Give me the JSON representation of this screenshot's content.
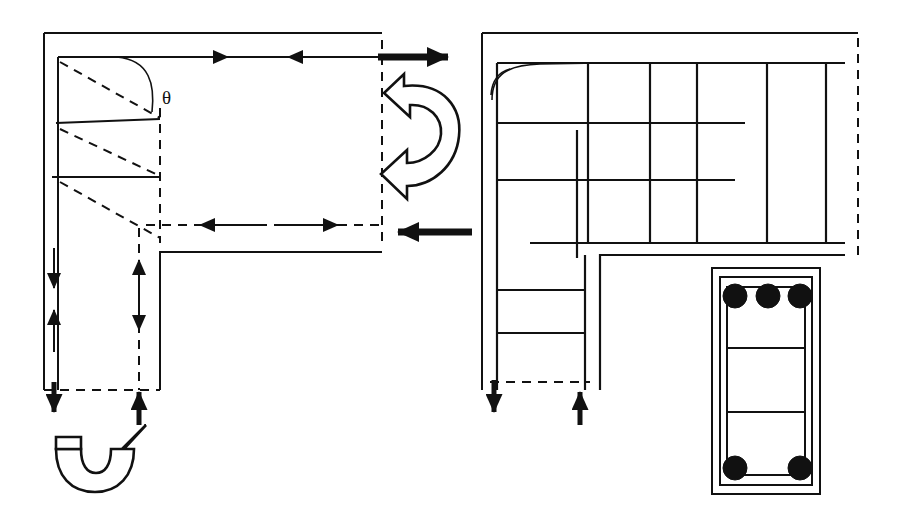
{
  "figure": {
    "background_color": "#ffffff",
    "line_color": "#111111",
    "annotations": [
      {
        "id": "theta",
        "label": "θ",
        "x": 168,
        "y": 97,
        "description": "rotation angle symbol theta"
      }
    ]
  },
  "panels": [
    {
      "id": "left-panel",
      "name": "force-and-deformation-diagram",
      "description": "L-shaped joint outline with dashed deformed shape, strain wedges, and force/moment arrows"
    },
    {
      "id": "right-panel",
      "name": "reinforcement-layout-diagram",
      "description": "L-shaped joint with orthogonal reinforcement bar grid and support reactions"
    },
    {
      "id": "section-detail",
      "name": "rebar-cross-section",
      "description": "Rectangular column section with stirrup and longitudinal reinforcing bars"
    }
  ],
  "left_panel": {
    "outline": {
      "points": "44,33 382,33 382,243 160,243 160,390 44,390",
      "style": "solid thin outer boundary, open right/bottom"
    },
    "inner_solid_lines": [
      {
        "name": "top-inner-edge",
        "x1": 58,
        "y1": 57,
        "x2": 382,
        "y2": 57
      },
      {
        "name": "left-inner-edge",
        "x1": 58,
        "y1": 57,
        "x2": 58,
        "y2": 390
      },
      {
        "name": "strain-line-1",
        "x1": 58,
        "y1": 124,
        "x2": 160,
        "y2": 120
      },
      {
        "name": "strain-line-2",
        "x1": 52,
        "y1": 177,
        "x2": 160,
        "y2": 177
      },
      {
        "name": "inner-corner-vertical",
        "x1": 160,
        "y1": 252,
        "x2": 160,
        "y2": 390
      },
      {
        "name": "inner-corner-horizontal",
        "x1": 160,
        "y1": 252,
        "x2": 382,
        "y2": 252
      }
    ],
    "dashed_lines": [
      {
        "name": "deformed-diag-1",
        "x1": 58,
        "y1": 62,
        "x2": 160,
        "y2": 120
      },
      {
        "name": "deformed-diag-2",
        "x1": 58,
        "y1": 130,
        "x2": 160,
        "y2": 180
      },
      {
        "name": "deformed-diag-3",
        "x1": 58,
        "y1": 183,
        "x2": 160,
        "y2": 240
      },
      {
        "name": "vertical-dashed-neutral-axis",
        "x1": 160,
        "y1": 110,
        "x2": 160,
        "y2": 243
      },
      {
        "name": "vertical-dashed-center",
        "x1": 139,
        "y1": 243,
        "x2": 139,
        "y2": 390
      },
      {
        "name": "bottom-dashed",
        "x1": 58,
        "y1": 390,
        "x2": 160,
        "y2": 390
      },
      {
        "name": "right-dashed-edge",
        "x1": 382,
        "y1": 57,
        "x2": 382,
        "y2": 243
      },
      {
        "name": "mid-dashed-horizontal",
        "x1": 160,
        "y1": 225,
        "x2": 382,
        "y2": 225
      }
    ],
    "arrows": [
      {
        "name": "top-arrow-right",
        "direction": "right",
        "type": "thin",
        "x1": 150,
        "y1": 57,
        "x2": 228,
        "y2": 57,
        "label": ""
      },
      {
        "name": "top-arrow-left",
        "direction": "left",
        "type": "thin",
        "x1": 340,
        "y1": 57,
        "x2": 287,
        "y2": 57,
        "label": ""
      },
      {
        "name": "mid-arrow-left",
        "direction": "left",
        "type": "thin",
        "x1": 260,
        "y1": 225,
        "x2": 198,
        "y2": 225,
        "label": ""
      },
      {
        "name": "mid-arrow-right",
        "direction": "right",
        "type": "thin",
        "x1": 275,
        "y1": 225,
        "x2": 335,
        "y2": 225,
        "label": ""
      },
      {
        "name": "applied-force-top-right",
        "direction": "right",
        "type": "thick",
        "x1": 378,
        "y1": 57,
        "x2": 462,
        "y2": 57,
        "label": ""
      },
      {
        "name": "applied-force-mid-right",
        "direction": "left",
        "type": "thick",
        "x1": 470,
        "y1": 232,
        "x2": 382,
        "y2": 232,
        "label": ""
      },
      {
        "name": "left-reaction-down",
        "direction": "down",
        "type": "thin",
        "x1": 54,
        "y1": 250,
        "x2": 54,
        "y2": 290,
        "label": ""
      },
      {
        "name": "left-reaction-up",
        "direction": "up",
        "type": "thin",
        "x1": 54,
        "y1": 352,
        "x2": 54,
        "y2": 308,
        "label": ""
      },
      {
        "name": "left-reaction-thick-down",
        "direction": "down",
        "type": "thick",
        "x1": 54,
        "y1": 382,
        "x2": 54,
        "y2": 425,
        "label": ""
      },
      {
        "name": "center-reaction-up",
        "direction": "up",
        "type": "thin",
        "x1": 139,
        "y1": 300,
        "x2": 139,
        "y2": 258,
        "label": ""
      },
      {
        "name": "center-reaction-down",
        "direction": "down",
        "type": "thin",
        "x1": 139,
        "y1": 300,
        "x2": 139,
        "y2": 335,
        "label": ""
      },
      {
        "name": "center-reaction-thick-up",
        "direction": "up",
        "type": "thick",
        "x1": 139,
        "y1": 425,
        "x2": 139,
        "y2": 382,
        "label": ""
      }
    ],
    "moment_arrows": [
      {
        "name": "moment-arrow-clockwise-top",
        "position": "right of joint, upper",
        "rotation": "clockwise",
        "cx": 421,
        "cy": 137
      },
      {
        "name": "moment-arrow-counterclockwise-bottom",
        "position": "below left column",
        "rotation": "counterclockwise",
        "cx": 106,
        "cy": 462
      }
    ],
    "curve": {
      "name": "rotation-arc",
      "description": "small arc marking rotation angle theta near top-left corner"
    }
  },
  "right_panel": {
    "outline": {
      "points": "482,33 860,33 860,240 600,240 600,390 482,390",
      "style": "solid thin outer boundary with dashed right edge"
    },
    "inner_edges": [
      {
        "name": "inner-top",
        "x1": 497,
        "y1": 63,
        "x2": 845,
        "y2": 63
      },
      {
        "name": "inner-left",
        "x1": 497,
        "y1": 63,
        "x2": 497,
        "y2": 390
      },
      {
        "name": "inner-bottom-right",
        "x1": 585,
        "y1": 255,
        "x2": 845,
        "y2": 255
      },
      {
        "name": "inner-right-vertical",
        "x1": 585,
        "y1": 255,
        "x2": 585,
        "y2": 390
      }
    ],
    "reinforcement_grid": {
      "vertical_bars": [
        {
          "name": "vbar-1",
          "x": 588,
          "y1": 63,
          "y2": 243
        },
        {
          "name": "vbar-2",
          "x": 650,
          "y1": 63,
          "y2": 243
        },
        {
          "name": "vbar-3",
          "x": 697,
          "y1": 63,
          "y2": 243
        },
        {
          "name": "vbar-4",
          "x": 767,
          "y1": 63,
          "y2": 243
        },
        {
          "name": "vbar-5",
          "x": 826,
          "y1": 63,
          "y2": 243
        },
        {
          "name": "vbar-short-stub",
          "x": 577,
          "y1": 130,
          "y2": 255
        }
      ],
      "horizontal_bars": [
        {
          "name": "hbar-1",
          "y": 123,
          "x1": 497,
          "x2": 745
        },
        {
          "name": "hbar-2",
          "y": 180,
          "x1": 497,
          "x2": 735
        },
        {
          "name": "hbar-3",
          "y": 243,
          "x1": 530,
          "x2": 845
        },
        {
          "name": "hbar-4",
          "y": 290,
          "x1": 497,
          "x2": 585
        },
        {
          "name": "hbar-5",
          "y": 333,
          "x1": 497,
          "x2": 585
        }
      ],
      "curved_bar": {
        "name": "bent-bar-hook",
        "description": "hooked top-left reinforcement bar with rounded bend"
      }
    },
    "dashed_lines": [
      {
        "name": "right-dashed-edge",
        "x1": 860,
        "y1": 40,
        "x2": 860,
        "y2": 255
      },
      {
        "name": "bottom-dashed",
        "x1": 497,
        "y1": 390,
        "x2": 585,
        "y2": 390
      }
    ],
    "arrows": [
      {
        "name": "support-reaction-down",
        "direction": "down",
        "type": "thick",
        "x1": 494,
        "y1": 385,
        "x2": 494,
        "y2": 428
      },
      {
        "name": "support-reaction-up",
        "direction": "up",
        "type": "thick",
        "x1": 580,
        "y1": 428,
        "x2": 580,
        "y2": 385
      }
    ]
  },
  "section_detail": {
    "name": "rebar-cross-section",
    "outer_rect": {
      "x": 712,
      "y": 268,
      "width": 108,
      "height": 226
    },
    "inner_rect": {
      "x": 720,
      "y": 277,
      "width": 92,
      "height": 208
    },
    "stirrup_rect": {
      "x": 727,
      "y": 287,
      "width": 78,
      "height": 188
    },
    "horizontal_ties": [
      {
        "name": "tie-1",
        "y": 348
      },
      {
        "name": "tie-2",
        "y": 412
      }
    ],
    "bars": [
      {
        "name": "rebar-top-left",
        "cx": 735,
        "cy": 296,
        "r": 12
      },
      {
        "name": "rebar-top-center",
        "cx": 768,
        "cy": 296,
        "r": 12
      },
      {
        "name": "rebar-top-right",
        "cx": 800,
        "cy": 296,
        "r": 12
      },
      {
        "name": "rebar-bottom-left",
        "cx": 735,
        "cy": 468,
        "r": 12
      },
      {
        "name": "rebar-bottom-right",
        "cx": 800,
        "cy": 468,
        "r": 12
      }
    ],
    "bar_count_top": 3,
    "bar_count_bottom": 2
  }
}
